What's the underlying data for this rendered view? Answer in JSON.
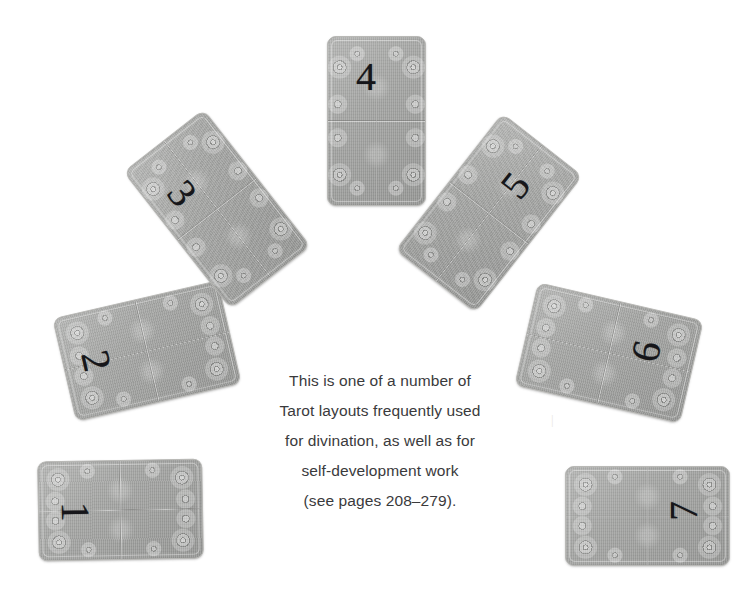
{
  "page": {
    "background_color": "#ffffff",
    "width": 752,
    "height": 600
  },
  "colors": {
    "card_face": "#9d9e9c",
    "card_border": "#b9b9b6",
    "number_ink": "#16161a",
    "caption_text": "#3a3a3c",
    "ghost_artifact": "#e9e7e4"
  },
  "layout": {
    "name": "seven-card-fan",
    "card_count": 7,
    "arrangement": "semicircular fan, numbered 1 at lower-left through 7 at lower-right",
    "cards": [
      {
        "number": "1",
        "name": "card-1",
        "left": 38,
        "top": 460,
        "width": 163,
        "height": 98,
        "rotation_deg": -1,
        "number_rotation_deg": 90,
        "number_left": 26,
        "number_top": 30
      },
      {
        "number": "2",
        "name": "card-2",
        "left": 62,
        "top": 298,
        "width": 168,
        "height": 104,
        "rotation_deg": -13,
        "number_rotation_deg": 90,
        "number_left": 22,
        "number_top": 30
      },
      {
        "number": "3",
        "name": "card-3",
        "left": 166,
        "top": 122,
        "width": 100,
        "height": 172,
        "rotation_deg": -38,
        "number_rotation_deg": 90,
        "number_left": 22,
        "number_top": 32
      },
      {
        "number": "4",
        "name": "card-4",
        "left": 327,
        "top": 36,
        "width": 97,
        "height": 168,
        "rotation_deg": 0,
        "number_rotation_deg": 0,
        "number_left": 28,
        "number_top": 20
      },
      {
        "number": "5",
        "name": "card-5",
        "left": 438,
        "top": 126,
        "width": 100,
        "height": 172,
        "rotation_deg": 38,
        "number_rotation_deg": -90,
        "number_left": 44,
        "number_top": 28
      },
      {
        "number": "6",
        "name": "card-6",
        "left": 524,
        "top": 300,
        "width": 168,
        "height": 104,
        "rotation_deg": 13,
        "number_rotation_deg": -90,
        "number_left": 110,
        "number_top": 22
      },
      {
        "number": "7",
        "name": "card-7",
        "left": 565,
        "top": 466,
        "width": 163,
        "height": 98,
        "rotation_deg": 0,
        "number_rotation_deg": -90,
        "number_left": 108,
        "number_top": 24
      }
    ]
  },
  "caption": {
    "lines": [
      "This is one of a number of",
      "Tarot layouts frequently used",
      "for divination, as well as for",
      "self-development work",
      "(see pages 208–279)."
    ]
  },
  "artifacts": {
    "description": "faint scanner bleed-through text ghosts from the reverse page",
    "items": [
      {
        "text": "|",
        "left": 505,
        "top": 118,
        "size": 14,
        "rotation_deg": 0
      },
      {
        "text": "later",
        "left": 489,
        "top": 174,
        "size": 15,
        "rotation_deg": 180
      },
      {
        "text": "reg",
        "left": 543,
        "top": 302,
        "size": 13,
        "rotation_deg": 180
      },
      {
        "text": "|",
        "left": 551,
        "top": 412,
        "size": 13,
        "rotation_deg": 0
      }
    ]
  }
}
